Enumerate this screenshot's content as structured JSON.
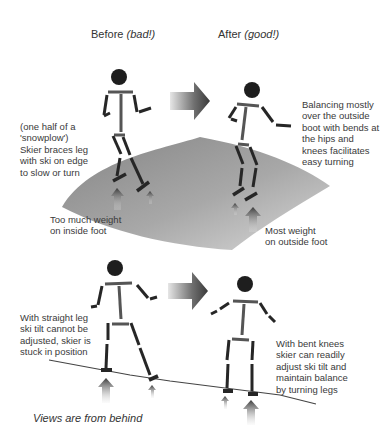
{
  "headers": {
    "before": {
      "label": "Before",
      "note": "(bad!)"
    },
    "after": {
      "label": "After",
      "note": "(good!)"
    }
  },
  "top_panel": {
    "left_caption": "(one half of a\n'snowplow')\nSkier braces leg\nwith ski on edge\nto slow or turn",
    "right_caption": "Balancing mostly\nover the outside\nboot with bends at\nthe hips and\nknees facilitates\neasy turning",
    "left_weight_note": "Too much weight\non inside foot",
    "right_weight_note": "Most weight\non outside foot"
  },
  "bottom_panel": {
    "left_caption": "With straight leg\nski tilt cannot be\nadjusted, skier is\nstuck in position",
    "right_caption": "With bent knees\nskier can readily\nadjust ski tilt and\nmaintain balance\nby turning legs"
  },
  "footer": "Views are from behind",
  "colors": {
    "figure": "#1e1e1e",
    "limb": "#2a2a2a",
    "slope_dark": "#8c8c8c",
    "slope_light": "#d4d4d4",
    "arrow_dark": "#3c3c3c",
    "arrow_light": "#e0e0e0"
  }
}
